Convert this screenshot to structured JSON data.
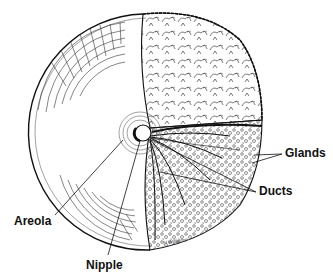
{
  "diagram": {
    "labels": {
      "glands": "Glands",
      "ducts": "Ducts",
      "areola": "Areola",
      "nipple": "Nipple"
    },
    "signature": "H Williams"
  }
}
